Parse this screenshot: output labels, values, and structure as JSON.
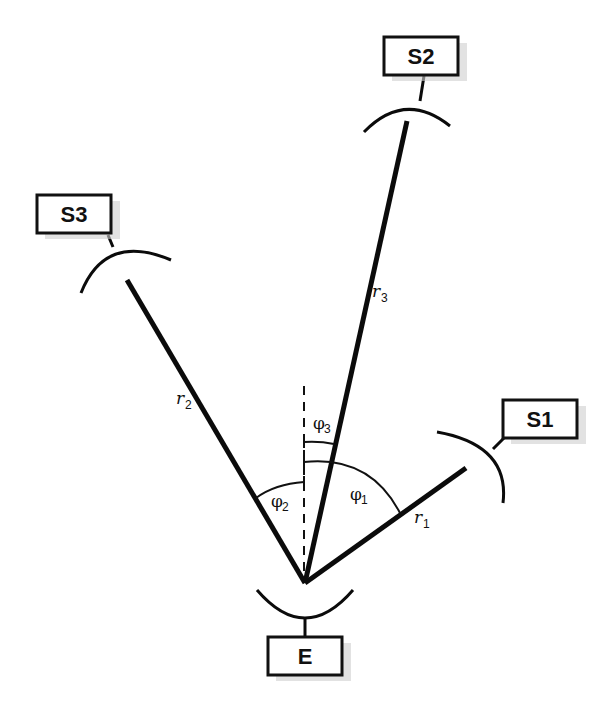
{
  "diagram": {
    "origin": {
      "label": "E",
      "x": 305,
      "y": 583
    },
    "stations": [
      {
        "id": "S1",
        "label": "S1"
      },
      {
        "id": "S2",
        "label": "S2"
      },
      {
        "id": "S3",
        "label": "S3"
      },
      {
        "id": "E",
        "label": "E"
      }
    ],
    "distances": [
      {
        "symbol": "r",
        "sub": "1"
      },
      {
        "symbol": "r",
        "sub": "2"
      },
      {
        "symbol": "r",
        "sub": "3"
      }
    ],
    "angles": [
      {
        "symbol": "φ",
        "sub": "1"
      },
      {
        "symbol": "φ",
        "sub": "2"
      },
      {
        "symbol": "φ",
        "sub": "3"
      }
    ]
  }
}
